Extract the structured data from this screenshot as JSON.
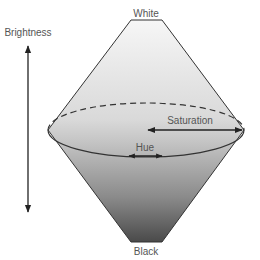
{
  "diagram": {
    "labels": {
      "top": "White",
      "bottom": "Black",
      "axis": "Brightness",
      "radius": "Saturation",
      "circumference": "Hue"
    },
    "colors": {
      "top_fill": "#f4f4f4",
      "equator_fill": "#c8c8c8",
      "bottom_fill": "#505050",
      "stroke": "#333333",
      "text": "#555555"
    }
  }
}
